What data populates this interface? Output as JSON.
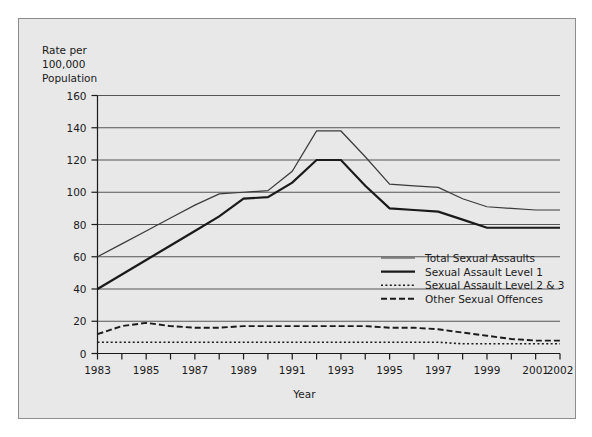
{
  "chart_data": {
    "type": "line",
    "title": "",
    "xlabel": "Year",
    "ylabel": "Rate per 100,000 Population",
    "ylabel_lines": [
      "Rate per",
      "100,000",
      "Population"
    ],
    "xlim": [
      1983,
      2002
    ],
    "ylim": [
      0,
      160
    ],
    "ytick_step": 20,
    "yticks": [
      0,
      20,
      40,
      60,
      80,
      100,
      120,
      140,
      160
    ],
    "xticks": [
      1983,
      1984,
      1985,
      1986,
      1987,
      1988,
      1989,
      1990,
      1991,
      1992,
      1993,
      1994,
      1995,
      1996,
      1997,
      1998,
      1999,
      2000,
      2001,
      2002
    ],
    "xtick_labels": [
      "1983",
      "",
      "1985",
      "",
      "1987",
      "",
      "1989",
      "",
      "1991",
      "",
      "1993",
      "",
      "1995",
      "",
      "1997",
      "",
      "1999",
      "",
      "2001",
      "2002"
    ],
    "grid": "horizontal",
    "legend_position": "inside-right-middle",
    "x": [
      1983,
      1984,
      1985,
      1986,
      1987,
      1988,
      1989,
      1990,
      1991,
      1992,
      1993,
      1994,
      1995,
      1996,
      1997,
      1998,
      1999,
      2000,
      2001,
      2002
    ],
    "series": [
      {
        "name": "Total Sexual Assaults",
        "style": "solid-thin",
        "color": "#3a3a3a",
        "values": [
          60,
          68,
          76,
          84,
          92,
          99,
          100,
          101,
          113,
          138,
          138,
          122,
          105,
          104,
          103,
          96,
          91,
          90,
          89,
          89
        ]
      },
      {
        "name": "Sexual Assault Level 1",
        "style": "solid-thick",
        "color": "#1a1a1a",
        "values": [
          40,
          49,
          58,
          67,
          76,
          85,
          96,
          97,
          106,
          120,
          120,
          104,
          90,
          89,
          88,
          83,
          78,
          78,
          78,
          78
        ]
      },
      {
        "name": "Sexual Assault Level 2 & 3",
        "style": "dotted",
        "color": "#1a1a1a",
        "values": [
          7,
          7,
          7,
          7,
          7,
          7,
          7,
          7,
          7,
          7,
          7,
          7,
          7,
          7,
          7,
          6,
          6,
          6,
          6,
          6
        ]
      },
      {
        "name": "Other Sexual Offences",
        "style": "dashed",
        "color": "#1a1a1a",
        "values": [
          12,
          17,
          19,
          17,
          16,
          16,
          17,
          17,
          17,
          17,
          17,
          17,
          16,
          16,
          15,
          13,
          11,
          9,
          8,
          8
        ]
      }
    ]
  },
  "axes": {
    "y_title_lines": [
      "Rate per",
      "100,000",
      "Population"
    ],
    "x_title": "Year"
  },
  "legend": {
    "items": [
      {
        "label": "Total Sexual Assaults",
        "swatch": "solid-thin-line-swatch"
      },
      {
        "label": "Sexual Assault Level 1",
        "swatch": "solid-thick-line-swatch"
      },
      {
        "label": "Sexual Assault Level 2 & 3",
        "swatch": "dotted-line-swatch"
      },
      {
        "label": "Other Sexual Offences",
        "swatch": "dashed-line-swatch"
      }
    ]
  },
  "colors": {
    "panel_background": "#e8e8e8",
    "panel_border": "#8d8d8d",
    "grid": "#555555",
    "axis": "#1a1a1a",
    "text": "#1a1a1a"
  }
}
